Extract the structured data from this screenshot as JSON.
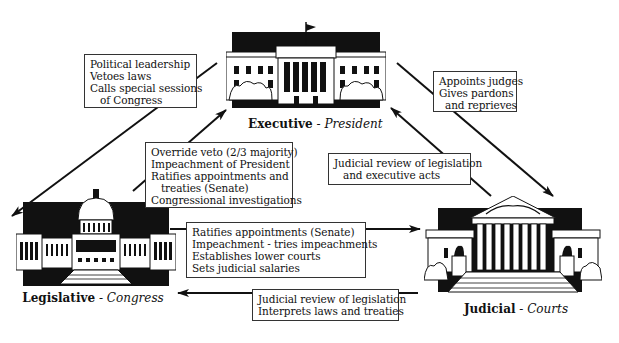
{
  "diagram": {
    "type": "checks-and-balances",
    "branches": {
      "executive": {
        "name": "Executive",
        "separator": " - ",
        "role": "President",
        "icon": "white-house-icon"
      },
      "legislative": {
        "name": "Legislative",
        "separator": " - ",
        "role": "Congress",
        "icon": "capitol-building-icon"
      },
      "judicial": {
        "name": "Judicial",
        "separator": " - ",
        "role": "Courts",
        "icon": "supreme-court-icon"
      }
    },
    "relations": {
      "executive_to_legislative": {
        "from": "Executive",
        "to": "Legislative",
        "lines": [
          "Political leadership",
          "Vetoes laws",
          "Calls special sessions",
          "of Congress"
        ]
      },
      "legislative_to_executive": {
        "from": "Legislative",
        "to": "Executive",
        "lines": [
          "Override veto (2/3 majority)",
          "Impeachment of President",
          "Ratifies appointments and",
          "treaties (Senate)",
          "Congressional investigations"
        ]
      },
      "executive_to_judicial": {
        "from": "Executive",
        "to": "Judicial",
        "lines": [
          "Appoints judges",
          "Gives pardons",
          "and reprieves"
        ]
      },
      "judicial_to_executive": {
        "from": "Judicial",
        "to": "Executive",
        "lines": [
          "Judicial review of legislation",
          "and executive acts"
        ]
      },
      "legislative_to_judicial": {
        "from": "Legislative",
        "to": "Judicial",
        "lines": [
          "Ratifies appointments (Senate)",
          "Impeachment - tries impeachments",
          "Establishes lower courts",
          "Sets judicial salaries"
        ]
      },
      "judicial_to_legislative": {
        "from": "Judicial",
        "to": "Legislative",
        "lines": [
          "Judicial review of legislation",
          "Interprets laws and treaties"
        ]
      }
    },
    "colors": {
      "ink": "#111111",
      "background": "#ffffff",
      "box_border": "#333333"
    }
  }
}
